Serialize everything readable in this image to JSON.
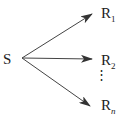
{
  "diagram": {
    "source": {
      "label": "S"
    },
    "targets": [
      {
        "label": "R",
        "sub": "1"
      },
      {
        "label": "R",
        "sub": "2"
      },
      {
        "label": "R",
        "sub": "n"
      }
    ],
    "ellipsis": "⋮",
    "colors": {
      "stroke": "#333333",
      "text": "#222222"
    }
  }
}
